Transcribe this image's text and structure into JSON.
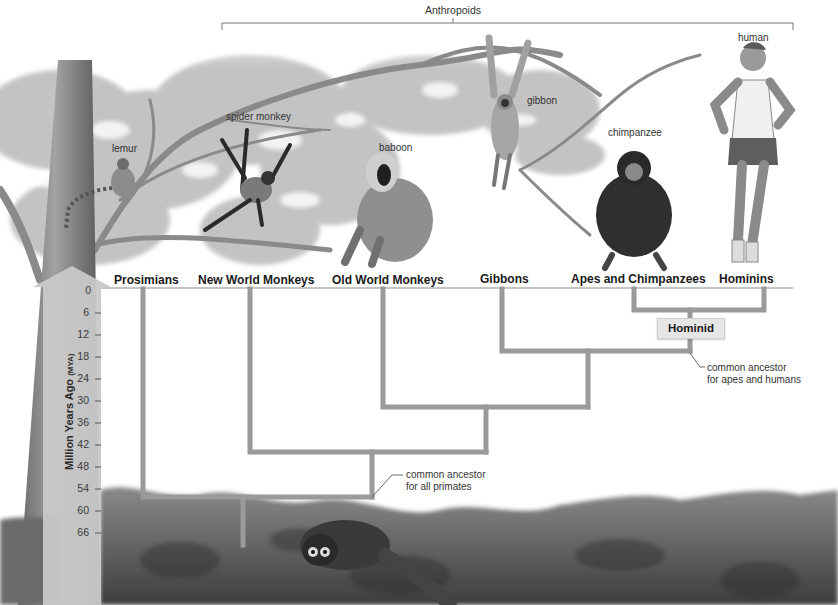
{
  "top_bracket": {
    "label": "Anthropoids"
  },
  "animals": [
    {
      "name": "lemur"
    },
    {
      "name": "spider monkey"
    },
    {
      "name": "baboon"
    },
    {
      "name": "gibbon"
    },
    {
      "name": "chimpanzee"
    },
    {
      "name": "human"
    }
  ],
  "groups": [
    {
      "label": "Prosimians"
    },
    {
      "label": "New World Monkeys"
    },
    {
      "label": "Old World Monkeys"
    },
    {
      "label": "Gibbons"
    },
    {
      "label": "Apes and Chimpanzees"
    },
    {
      "label": "Hominins"
    }
  ],
  "axis": {
    "title": "Million Years Ago",
    "unit": "(MYA)",
    "ticks": [
      "0",
      "6",
      "12",
      "18",
      "24",
      "30",
      "36",
      "42",
      "48",
      "54",
      "60",
      "66"
    ]
  },
  "nodes": {
    "hominid_label": "Hominid"
  },
  "annotations": {
    "apes_humans_line1": "common ancestor",
    "apes_humans_line2": "for apes and humans",
    "all_primates_line1": "common ancestor",
    "all_primates_line2": "for all primates"
  },
  "colors": {
    "tree_line": "#9a9a9a",
    "arrow_fill": "#c8c8c8",
    "text": "#1a1a1a"
  }
}
